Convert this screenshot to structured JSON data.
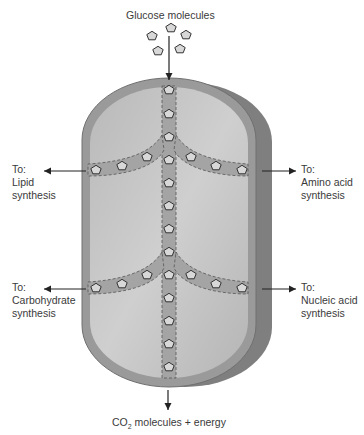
{
  "title_top": "Glucose molecules",
  "bottom_label": {
    "prefix": "CO",
    "subscript": "2",
    "suffix": " molecules + energy"
  },
  "labels": {
    "top_left": {
      "line1": "To:",
      "line2": "Lipid",
      "line3": "synthesis"
    },
    "top_right": {
      "line1": "To:",
      "line2": "Amino acid",
      "line3": "synthesis"
    },
    "bottom_left": {
      "line1": "To:",
      "line2": "Carbohydrate",
      "line3": "synthesis"
    },
    "bottom_right": {
      "line1": "To:",
      "line2": "Nucleic acid",
      "line3": "synthesis"
    }
  },
  "colors": {
    "cell_outer": "#8a8a8a",
    "cell_rim": "#a0a0a0",
    "cell_inner": "#c4c4c4",
    "pathway": "#a8a8a8",
    "molecule": "#d8d8d8"
  }
}
